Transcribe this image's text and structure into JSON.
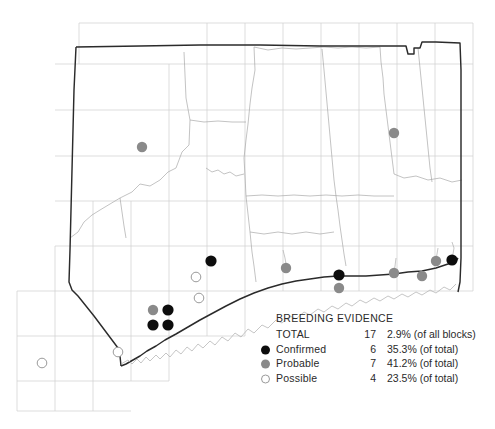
{
  "figure": {
    "kind": "species-distribution-map",
    "region": "Connecticut"
  },
  "legend": {
    "title": "BREEDING EVIDENCE",
    "rows": [
      {
        "symbol": "none",
        "label": "TOTAL",
        "count": "17",
        "percent": "2.9% (of all blocks)"
      },
      {
        "symbol": "confirmed",
        "label": "Confirmed",
        "count": "6",
        "percent": "35.3% (of total)"
      },
      {
        "symbol": "probable",
        "label": "Probable",
        "count": "7",
        "percent": "41.2% (of total)"
      },
      {
        "symbol": "possible",
        "label": "Possible",
        "count": "4",
        "percent": "23.5% (of total)"
      }
    ]
  },
  "colors": {
    "confirmed": "#0d0d0d",
    "probable": "#8a8a8a",
    "possible_fill": "#ffffff",
    "possible_stroke": "#9a9a9a",
    "grid": "#c9c9c9",
    "state_border": "#2b2b2b",
    "county_border": "#9d9d9d"
  },
  "chart_data": {
    "type": "scatter",
    "title": "BREEDING EVIDENCE",
    "xlabel": "",
    "ylabel": "",
    "grid": true,
    "legend_position": "bottom-right",
    "categories": [
      "Confirmed",
      "Probable",
      "Possible"
    ],
    "values": [
      6,
      7,
      4
    ],
    "total": 17,
    "percents": [
      "35.3%",
      "41.2%",
      "23.5%"
    ],
    "total_percent": "2.9%",
    "points": [
      {
        "x": 142,
        "y": 147,
        "evidence": "Probable"
      },
      {
        "x": 394,
        "y": 133,
        "evidence": "Probable"
      },
      {
        "x": 211,
        "y": 261,
        "evidence": "Confirmed"
      },
      {
        "x": 196,
        "y": 277,
        "evidence": "Possible"
      },
      {
        "x": 199,
        "y": 298,
        "evidence": "Possible"
      },
      {
        "x": 153,
        "y": 310,
        "evidence": "Probable"
      },
      {
        "x": 168,
        "y": 310,
        "evidence": "Confirmed"
      },
      {
        "x": 153,
        "y": 325,
        "evidence": "Confirmed"
      },
      {
        "x": 168,
        "y": 325,
        "evidence": "Confirmed"
      },
      {
        "x": 42,
        "y": 363,
        "evidence": "Possible"
      },
      {
        "x": 118,
        "y": 352,
        "evidence": "Possible"
      },
      {
        "x": 339,
        "y": 275,
        "evidence": "Confirmed"
      },
      {
        "x": 339,
        "y": 288,
        "evidence": "Probable"
      },
      {
        "x": 286,
        "y": 268,
        "evidence": "Probable"
      },
      {
        "x": 394,
        "y": 273,
        "evidence": "Probable"
      },
      {
        "x": 422,
        "y": 276,
        "evidence": "Probable"
      },
      {
        "x": 436,
        "y": 261,
        "evidence": "Probable"
      },
      {
        "x": 452,
        "y": 260,
        "evidence": "Confirmed"
      }
    ]
  }
}
